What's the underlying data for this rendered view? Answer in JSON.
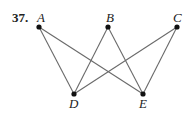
{
  "problem_number": "37.",
  "graph": {
    "vertices": [
      {
        "id": "A",
        "label": "A",
        "x": 39,
        "y": 27,
        "lx": 37,
        "ly": 22
      },
      {
        "id": "B",
        "label": "B",
        "x": 108,
        "y": 27,
        "lx": 106,
        "ly": 22
      },
      {
        "id": "C",
        "label": "C",
        "x": 177,
        "y": 27,
        "lx": 173,
        "ly": 22
      },
      {
        "id": "D",
        "label": "D",
        "x": 74,
        "y": 94,
        "lx": 69,
        "ly": 108
      },
      {
        "id": "E",
        "label": "E",
        "x": 143,
        "y": 94,
        "lx": 139,
        "ly": 108
      }
    ],
    "edges": [
      [
        "A",
        "D"
      ],
      [
        "A",
        "E"
      ],
      [
        "B",
        "D"
      ],
      [
        "B",
        "E"
      ],
      [
        "C",
        "D"
      ],
      [
        "C",
        "E"
      ]
    ]
  }
}
